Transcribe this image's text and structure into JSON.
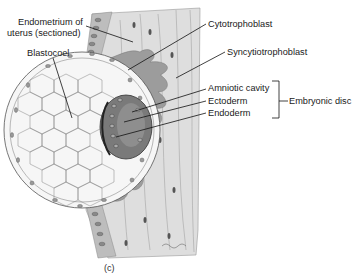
{
  "figure": {
    "caption": "(c)",
    "labels": {
      "endometrium_line1": "Endometrium of",
      "endometrium_line2": "uterus (sectioned)",
      "blastocoel": "Blastocoel",
      "cytotrophoblast": "Cytotrophoblast",
      "syncytiotrophoblast": "Syncytiotrophoblast",
      "amniotic_cavity": "Amniotic cavity",
      "ectoderm": "Ectoderm",
      "endoderm": "Endoderm",
      "embryonic_disc": "Embryonic disc"
    },
    "colors": {
      "uterus_tissue": "#dcdcdc",
      "syncytiotrophoblast": "#9a9a9a",
      "epithelium": "#b8b8b8",
      "blastocyst_fill": "#f4f4f4",
      "cell_outline": "#555555",
      "disc_dark": "#6e6e6e",
      "leader_line": "#111111"
    }
  }
}
